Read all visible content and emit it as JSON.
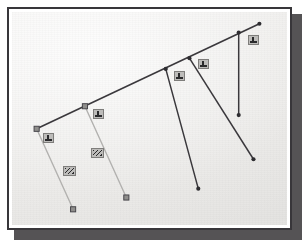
{
  "figure": {
    "background_color": "#f3f2f0",
    "frame_color": "#38363a",
    "shadow_color": "#555355",
    "page_color": "#ffffff"
  },
  "palette": {
    "dark_line": "#3a383c",
    "light_line": "#b2b1af",
    "node_fill": "#8f8e8c",
    "node_stroke": "#46454a",
    "dot_fill": "#2e2d31",
    "chip_fill": "#bdbcba",
    "chip_stroke": "#7e7d7b",
    "chip_ink": "#2a2a2c"
  },
  "diagram": {
    "type": "line-diagram",
    "main_line": {
      "name": "main-ridge-line",
      "color": "#3a383c",
      "width": 1.6,
      "start": {
        "x": 35,
        "y": 129
      },
      "end": {
        "x": 261,
        "y": 22
      }
    },
    "nodes": [
      {
        "id": "node-1",
        "marker": "square",
        "x": 35,
        "y": 129,
        "label": "1"
      },
      {
        "id": "node-2",
        "marker": "square",
        "x": 84,
        "y": 106,
        "label": "2"
      },
      {
        "id": "node-3",
        "marker": "dot",
        "x": 166,
        "y": 68,
        "label": "3"
      },
      {
        "id": "node-4",
        "marker": "dot",
        "x": 190,
        "y": 57,
        "label": "4"
      },
      {
        "id": "node-5",
        "marker": "dot",
        "x": 240,
        "y": 31,
        "label": "5"
      },
      {
        "id": "node-6",
        "marker": "dot",
        "x": 261,
        "y": 22,
        "label": "6"
      }
    ],
    "branches": [
      {
        "id": "branch-1",
        "style": "light",
        "color": "#b2b1af",
        "from": {
          "x": 35,
          "y": 129
        },
        "to": {
          "x": 72,
          "y": 211
        },
        "end_marker": "square"
      },
      {
        "id": "branch-2",
        "style": "light",
        "color": "#b2b1af",
        "from": {
          "x": 84,
          "y": 106
        },
        "to": {
          "x": 126,
          "y": 199
        },
        "end_marker": "square"
      },
      {
        "id": "branch-3",
        "style": "dark",
        "color": "#3a383c",
        "from": {
          "x": 166,
          "y": 68
        },
        "to": {
          "x": 199,
          "y": 190
        },
        "end_marker": "dot"
      },
      {
        "id": "branch-4",
        "style": "dark",
        "color": "#3a383c",
        "from": {
          "x": 190,
          "y": 57
        },
        "to": {
          "x": 255,
          "y": 160
        },
        "end_marker": "dot"
      },
      {
        "id": "branch-5",
        "style": "dark",
        "color": "#3a383c",
        "from": {
          "x": 240,
          "y": 31
        },
        "to": {
          "x": 240,
          "y": 115
        },
        "end_marker": "dot"
      }
    ],
    "labels": [
      {
        "id": "label-node-1",
        "text": "1",
        "x": 41,
        "y": 131,
        "w": 11,
        "h": 10,
        "kind": "node-tag"
      },
      {
        "id": "label-node-2",
        "text": "2",
        "x": 91,
        "y": 107,
        "w": 11,
        "h": 10,
        "kind": "node-tag"
      },
      {
        "id": "label-node-3",
        "text": "3",
        "x": 172,
        "y": 69,
        "w": 11,
        "h": 10,
        "kind": "node-tag"
      },
      {
        "id": "label-node-4",
        "text": "4",
        "x": 196,
        "y": 57,
        "w": 11,
        "h": 10,
        "kind": "node-tag"
      },
      {
        "id": "label-node-5",
        "text": "5",
        "x": 246,
        "y": 33,
        "w": 11,
        "h": 10,
        "kind": "node-tag"
      },
      {
        "id": "label-branch-1",
        "text": "A",
        "x": 61,
        "y": 164,
        "w": 13,
        "h": 10,
        "kind": "branch-tag"
      },
      {
        "id": "label-branch-2",
        "text": "B",
        "x": 89,
        "y": 146,
        "w": 13,
        "h": 10,
        "kind": "branch-tag"
      }
    ]
  }
}
